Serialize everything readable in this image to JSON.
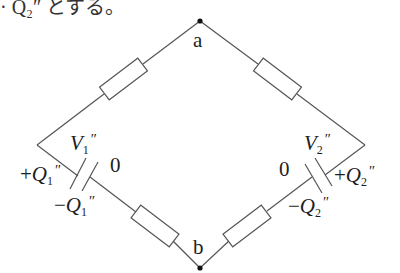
{
  "header_fragment": {
    "text": "· Q₂″ とする。"
  },
  "nodes": {
    "a": {
      "label": "a"
    },
    "b": {
      "label": "b"
    }
  },
  "labels": {
    "V1": {
      "main": "V",
      "sub": "1",
      "prime": "″"
    },
    "V2": {
      "main": "V",
      "sub": "2",
      "prime": "″"
    },
    "plusQ1": {
      "sign": "+",
      "main": "Q",
      "sub": "1",
      "prime": "″"
    },
    "minusQ1": {
      "sign": "−",
      "main": "Q",
      "sub": "1",
      "prime": "″"
    },
    "plusQ2": {
      "sign": "+",
      "main": "Q",
      "sub": "2",
      "prime": "″"
    },
    "minusQ2": {
      "sign": "−",
      "main": "Q",
      "sub": "2",
      "prime": "″"
    },
    "zero_left": "0",
    "zero_right": "0"
  },
  "components": {
    "resistors": [
      "upper-left",
      "upper-right",
      "lower-left",
      "lower-right"
    ],
    "capacitors": [
      "left-capacitor",
      "right-capacitor"
    ]
  },
  "colors": {
    "wire": "#555555",
    "node": "#111111",
    "text": "#1e1e1e"
  }
}
